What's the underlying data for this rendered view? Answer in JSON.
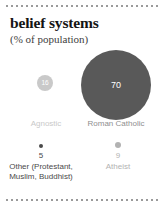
{
  "card": {
    "title": "belief systems",
    "subtitle": "(% of population)",
    "divider_top": "dotted-rule",
    "divider_bottom": "dotted-rule"
  },
  "colors": {
    "catholic_bubble": "#595959",
    "agnostic_bubble": "#c9c9c9",
    "other_dot": "#4a4a4a",
    "atheist_dot": "#b2b2b2",
    "rule": "#9a9a9a",
    "background": "#ffffff",
    "title_text": "#141414"
  },
  "bubbles": [
    {
      "label": "Roman Catholic",
      "value": "70"
    },
    {
      "label": "Agnostic",
      "value": "16"
    }
  ],
  "legend": [
    {
      "value": "5",
      "label_line1": "Other (Protestant,",
      "label_line2": "Muslim, Buddhist)"
    },
    {
      "value": "9",
      "label_line1": "Atheist",
      "label_line2": ""
    }
  ],
  "chart_data": {
    "type": "bar",
    "title": "belief systems",
    "subtitle": "(% of population)",
    "xlabel": "",
    "ylabel": "% of population",
    "categories": [
      "Roman Catholic",
      "Agnostic",
      "Atheist",
      "Other (Protestant, Muslim, Buddhist)"
    ],
    "values": [
      70,
      16,
      9,
      5
    ],
    "units": "percent",
    "ylim": [
      0,
      100
    ],
    "grid": false,
    "legend_position": "none",
    "encoding": "circle-area proportional to value",
    "annotations": [
      "70 — Roman Catholic",
      "16 — Agnostic",
      "9 — Atheist",
      "5 — Other (Protestant, Muslim, Buddhist)"
    ]
  }
}
